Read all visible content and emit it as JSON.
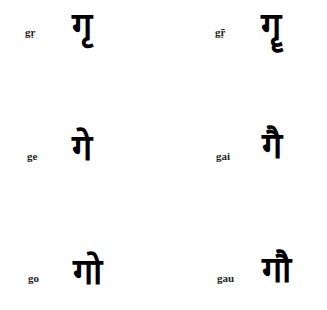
{
  "items": [
    {
      "label": "gṛ",
      "glyph": "गृ"
    },
    {
      "label": "gṝ",
      "glyph": "गॄ"
    },
    {
      "label": "ge",
      "glyph": "गे"
    },
    {
      "label": "gai",
      "glyph": "गै"
    },
    {
      "label": "go",
      "glyph": "गो"
    },
    {
      "label": "gau",
      "glyph": "गौ"
    }
  ]
}
